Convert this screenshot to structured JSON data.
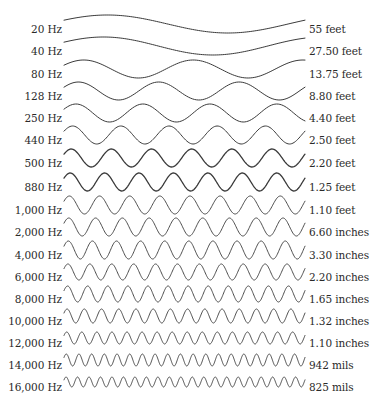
{
  "diagram": {
    "title": "",
    "wave_color": "#3a3a3a",
    "rows": [
      {
        "frequency": "20 Hz",
        "wavelength": "55 feet",
        "y": 28,
        "cycles": 1.0,
        "amp": 9,
        "phase": 0.14,
        "stroke": 1.0
      },
      {
        "frequency": "40 Hz",
        "wavelength": "27.50 feet",
        "y": 50,
        "cycles": 1.1,
        "amp": 9,
        "phase": 0.14,
        "stroke": 1.0
      },
      {
        "frequency": "80 Hz",
        "wavelength": "13.75 feet",
        "y": 73,
        "cycles": 2.2,
        "amp": 9,
        "phase": 0.14,
        "stroke": 1.0
      },
      {
        "frequency": "128 Hz",
        "wavelength": "8.80 feet",
        "y": 95,
        "cycles": 3.0,
        "amp": 9,
        "phase": 0.14,
        "stroke": 1.0
      },
      {
        "frequency": "250 Hz",
        "wavelength": "4.40 feet",
        "y": 117,
        "cycles": 3.6,
        "amp": 9,
        "phase": 0.14,
        "stroke": 1.0
      },
      {
        "frequency": "440 Hz",
        "wavelength": "2.50 feet",
        "y": 139,
        "cycles": 5.0,
        "amp": 9,
        "phase": 0.14,
        "stroke": 1.0
      },
      {
        "frequency": "500 Hz",
        "wavelength": "2.20 feet",
        "y": 162,
        "cycles": 6.0,
        "amp": 9,
        "phase": 0.14,
        "stroke": 1.3
      },
      {
        "frequency": "880 Hz",
        "wavelength": "1.25 feet",
        "y": 186,
        "cycles": 7.0,
        "amp": 9,
        "phase": 0.14,
        "stroke": 1.3
      },
      {
        "frequency": "1,000 Hz",
        "wavelength": "1.10 feet",
        "y": 209,
        "cycles": 8.0,
        "amp": 9,
        "phase": 0.14,
        "stroke": 0.9
      },
      {
        "frequency": "2,000 Hz",
        "wavelength": "6.60 inches",
        "y": 231,
        "cycles": 9.0,
        "amp": 9,
        "phase": 0.14,
        "stroke": 0.9
      },
      {
        "frequency": "4,000 Hz",
        "wavelength": "3.30 inches",
        "y": 254,
        "cycles": 10.0,
        "amp": 9,
        "phase": 0.14,
        "stroke": 0.9
      },
      {
        "frequency": "6,000 Hz",
        "wavelength": "2.20 inches",
        "y": 276,
        "cycles": 11.0,
        "amp": 8,
        "phase": 0.14,
        "stroke": 0.9
      },
      {
        "frequency": "8,000 Hz",
        "wavelength": "1.65 inches",
        "y": 298,
        "cycles": 12.0,
        "amp": 8,
        "phase": 0.14,
        "stroke": 0.9
      },
      {
        "frequency": "10,000 Hz",
        "wavelength": "1.32 inches",
        "y": 320,
        "cycles": 14.0,
        "amp": 7,
        "phase": 0.14,
        "stroke": 0.9
      },
      {
        "frequency": "12,000 Hz",
        "wavelength": "1.10 inches",
        "y": 342,
        "cycles": 16.0,
        "amp": 6,
        "phase": 0.14,
        "stroke": 0.9
      },
      {
        "frequency": "14,000 Hz",
        "wavelength": "942 mils",
        "y": 364,
        "cycles": 19.0,
        "amp": 6,
        "phase": 0.14,
        "stroke": 0.9
      },
      {
        "frequency": "16,000 Hz",
        "wavelength": "825 mils",
        "y": 386,
        "cycles": 21.0,
        "amp": 5,
        "phase": 0.14,
        "stroke": 0.9
      }
    ]
  }
}
